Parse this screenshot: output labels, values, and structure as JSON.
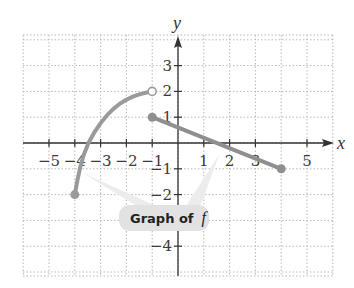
{
  "chart_data": {
    "type": "line",
    "title": "",
    "xlabel": "x",
    "ylabel": "y",
    "xlim": [
      -6,
      6
    ],
    "ylim": [
      -5.2,
      4.2
    ],
    "grid": true,
    "grid_style": "dotted",
    "x_ticks": [
      -5,
      -4,
      -3,
      -2,
      -1,
      1,
      2,
      3,
      5
    ],
    "x_tick_labels": [
      "−5",
      "−4",
      "−3",
      "−2",
      "−1",
      "1",
      "2",
      "3",
      "5"
    ],
    "y_ticks": [
      3,
      2,
      1,
      -1,
      -2,
      -4
    ],
    "y_tick_labels": [
      "3",
      "2",
      "1",
      "−1",
      "−2",
      "−4"
    ],
    "series": [
      {
        "name": "curve piece",
        "description": "increasing concave-down curve from (-4,-2) to (-1,2)",
        "points": [
          [
            -4,
            -2
          ],
          [
            -3.8,
            -0.9
          ],
          [
            -3.5,
            0.0
          ],
          [
            -3,
            0.8
          ],
          [
            -2.5,
            1.35
          ],
          [
            -2,
            1.7
          ],
          [
            -1.5,
            1.9
          ],
          [
            -1,
            2
          ]
        ],
        "start": {
          "x": -4,
          "y": -2,
          "marker": "closed"
        },
        "end": {
          "x": -1,
          "y": 2,
          "marker": "open"
        },
        "color": "#9a9a9a"
      },
      {
        "name": "line piece",
        "description": "straight segment from (-1,1) to (4,-1)",
        "points": [
          [
            -1,
            1
          ],
          [
            4,
            -1
          ]
        ],
        "start": {
          "x": -1,
          "y": 1,
          "marker": "closed"
        },
        "end": {
          "x": 4,
          "y": -1,
          "marker": "closed"
        },
        "color": "#8f8f8f"
      }
    ],
    "annotations": [
      {
        "text": "Graph of",
        "italic_suffix": "f",
        "position": {
          "x": -0.5,
          "y": -3
        },
        "pointers": [
          {
            "to": [
              -3.7,
              -1.2
            ]
          },
          {
            "to": [
              1.5,
              -0.5
            ]
          }
        ]
      }
    ]
  },
  "labels": {
    "x_axis": "x",
    "y_axis": "y",
    "callout": "Graph of",
    "callout_var": "f"
  },
  "colors": {
    "grid": "#b8b8b8",
    "axis": "#333333",
    "curve": "#9a9a9a",
    "line": "#8f8f8f",
    "callout_bg": "#e2e2e2",
    "pointer": "#ececec"
  }
}
